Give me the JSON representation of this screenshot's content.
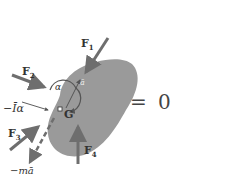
{
  "diagram": {
    "type": "kinetic free-body diagram",
    "body_color": "#9a9a9a",
    "arrow_color": "#6e6e6e",
    "labels": {
      "F1": {
        "base": "F",
        "sub": "1"
      },
      "F2": {
        "base": "F",
        "sub": "2"
      },
      "F3": {
        "base": "F",
        "sub": "3"
      },
      "F4": {
        "base": "F",
        "sub": "4"
      },
      "alpha": "α",
      "a_bar": "ā",
      "inertia_couple": "−Īα",
      "center": "G",
      "inertia_force": "−mā"
    },
    "equation": {
      "equals": "=",
      "rhs": "0"
    }
  }
}
